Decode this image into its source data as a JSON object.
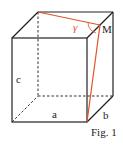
{
  "figure": {
    "caption": "Fig. 1",
    "labels": {
      "a": "a",
      "b": "b",
      "c": "c",
      "M": "M",
      "gamma": "γ"
    },
    "colors": {
      "edge": "#222222",
      "highlight": "#e0522a"
    }
  }
}
